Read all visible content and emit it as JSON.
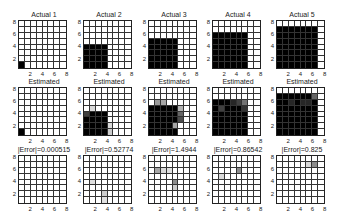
{
  "chart_data": {
    "type": "heatmap",
    "layout": {
      "rows": 3,
      "cols": 5
    },
    "axis": {
      "xticks": [
        2,
        4,
        6,
        8
      ],
      "yticks": [
        2,
        4,
        6,
        8
      ],
      "xlim": [
        0.5,
        8.5
      ],
      "ylim": [
        0.5,
        8.5
      ],
      "grid": true
    },
    "colormap": "gray (0=white, 1=black)",
    "rows": [
      {
        "name": "actual",
        "panels": [
          {
            "title": "Actual 1",
            "block_size": 1
          },
          {
            "title": "Actual 2",
            "block_size": 4
          },
          {
            "title": "Actual 3",
            "block_size": 5
          },
          {
            "title": "Actual 4",
            "block_size": 6
          },
          {
            "title": "Actual 5",
            "block_size": 7
          }
        ]
      },
      {
        "name": "estimated",
        "panels": [
          {
            "title": "Estimated",
            "block_size": 1,
            "gray_cells": []
          },
          {
            "title": "Estimated",
            "block_size": 4,
            "gray_cells": [
              [
                1,
                4,
                0.75
              ],
              [
                2,
                5,
                0.15
              ],
              [
                5,
                1,
                0.2
              ],
              [
                5,
                2,
                0.15
              ]
            ]
          },
          {
            "title": "Estimated",
            "block_size": 5,
            "gray_cells": [
              [
                2,
                6,
                0.4
              ],
              [
                3,
                6,
                0.35
              ],
              [
                6,
                3,
                0.7
              ],
              [
                6,
                4,
                0.6
              ],
              [
                6,
                5,
                0.3
              ],
              [
                5,
                2,
                0.35
              ]
            ]
          },
          {
            "title": "Estimated",
            "block_size": 6,
            "gray_cells": [
              [
                2,
                5,
                0.75
              ],
              [
                6,
                6,
                0.55
              ],
              [
                6,
                5,
                0.8
              ],
              [
                5,
                6,
                0.75
              ],
              [
                4,
                6,
                0.85
              ]
            ]
          },
          {
            "title": "Estimated",
            "block_size": 7,
            "gray_cells": [
              [
                7,
                7,
                0.6
              ],
              [
                3,
                6,
                0.85
              ],
              [
                5,
                6,
                0.85
              ],
              [
                6,
                6,
                0.85
              ]
            ]
          }
        ]
      },
      {
        "name": "error",
        "panels": [
          {
            "title": "|Error|=0.000515",
            "value": 0.000515,
            "gray_cells": []
          },
          {
            "title": "|Error|=0.52774",
            "value": 0.52774,
            "gray_cells": [
              [
                2,
                4,
                0.12
              ],
              [
                4,
                2,
                0.2
              ],
              [
                4,
                1,
                0.12
              ]
            ]
          },
          {
            "title": "|Error|=1.4944",
            "value": 1.4944,
            "gray_cells": [
              [
                2,
                6,
                0.35
              ],
              [
                3,
                6,
                0.15
              ],
              [
                4,
                6,
                0.12
              ],
              [
                5,
                4,
                0.45
              ],
              [
                5,
                3,
                0.2
              ]
            ]
          },
          {
            "title": "|Error|=0.86542",
            "value": 0.86542,
            "gray_cells": [
              [
                2,
                5,
                0.15
              ],
              [
                5,
                6,
                0.45
              ]
            ]
          },
          {
            "title": "|Error|=0.825",
            "value": 0.825,
            "gray_cells": [
              [
                7,
                7,
                0.45
              ],
              [
                6,
                7,
                0.15
              ]
            ]
          }
        ]
      }
    ]
  },
  "ticks": {
    "x": [
      "2",
      "4",
      "6",
      "8"
    ],
    "y": [
      "8",
      "6",
      "4",
      "2"
    ]
  }
}
